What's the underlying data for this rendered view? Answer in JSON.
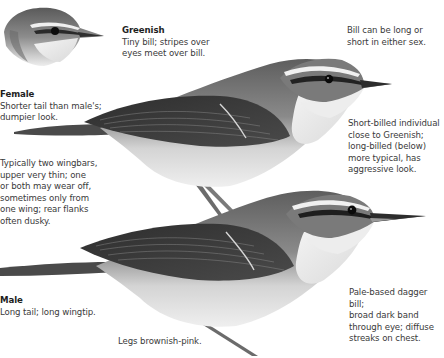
{
  "plate": {
    "subject": "Arctic/Greenish-type warbler identification plate",
    "figures": [
      {
        "id": "greenish-head",
        "label": "Greenish head inset"
      },
      {
        "id": "female-bird",
        "label": "Female (upper bird)"
      },
      {
        "id": "male-bird",
        "label": "Male (lower bird)"
      }
    ]
  },
  "annotations": {
    "greenish": {
      "title": "Greenish",
      "body": "Tiny bill; stripes over\neyes meet over bill."
    },
    "bill_sex": {
      "body": "Bill can be long or\nshort in either sex."
    },
    "female": {
      "title": "Female",
      "body": "Shorter tail than male's;\ndumpier look."
    },
    "wingbars": {
      "body": "Typically two wingbars,\nupper very thin; one\nor both may wear off,\nsometimes only from\none wing; rear flanks\noften dusky."
    },
    "short_billed": {
      "body": "Short-billed individual\nclose to Greenish;\nlong-billed (below)\nmore typical, has\naggressive look."
    },
    "male": {
      "title": "Male",
      "body": "Long tail; long wingtip."
    },
    "dagger_bill": {
      "body": "Pale-based dagger bill;\nbroad dark band\nthrough eye; diffuse\nstreaks on chest."
    },
    "legs": {
      "body": "Legs brownish-pink."
    }
  },
  "colors": {
    "background": "#ffffff",
    "text": "#3a3a3a",
    "title_text": "#1e1e1e",
    "plumage_upper": "#6f6f6f",
    "plumage_wing": "#3c3c3c",
    "underparts": "#e6e6e6",
    "supercilium": "#f2f2f2"
  }
}
